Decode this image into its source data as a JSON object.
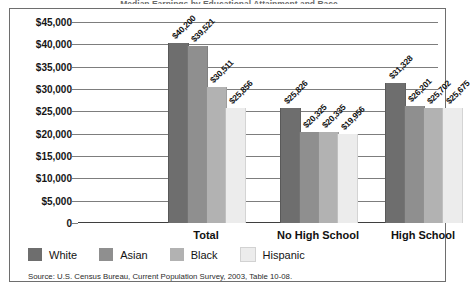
{
  "figure": {
    "title_clipped": "Median Earnings by Educational Attainment and Race",
    "source_note": "Source: U.S. Census Bureau, Current Population Survey, 2003, Table 10-08.",
    "border_color": "#6e6e6e",
    "gridline_color": "#7d7d7d"
  },
  "legend": {
    "position": "bottom-left",
    "items": [
      {
        "label": "White",
        "color": "#6e6e6e"
      },
      {
        "label": "Asian",
        "color": "#8f8f8f"
      },
      {
        "label": "Black",
        "color": "#b2b2b2"
      },
      {
        "label": "Hispanic",
        "color": "#ececec"
      }
    ]
  },
  "chart_data": {
    "type": "bar",
    "title": "Median Earnings by Educational Attainment and Race",
    "xlabel": "",
    "ylabel": "",
    "ylim": [
      0,
      45000
    ],
    "ytick_values": [
      0,
      5000,
      10000,
      15000,
      20000,
      25000,
      30000,
      35000,
      40000,
      45000
    ],
    "ytick_labels": [
      "0",
      "$5,000",
      "$10,000",
      "$15,000",
      "$20,000",
      "$25,000",
      "$30,000",
      "$35,000",
      "$40,000",
      "$45,000"
    ],
    "grid": true,
    "legend_position": "bottom-left",
    "categories": [
      "Total",
      "No High School",
      "High School"
    ],
    "series": [
      {
        "name": "White",
        "color": "#6e6e6e",
        "values": [
          40200,
          25826,
          31328
        ],
        "labels": [
          "$40,200",
          "$25,826",
          "$31,328"
        ]
      },
      {
        "name": "Asian",
        "color": "#8f8f8f",
        "values": [
          39521,
          20325,
          26201
        ],
        "labels": [
          "$39,521",
          "$20,325",
          "$26,201"
        ]
      },
      {
        "name": "Black",
        "color": "#b2b2b2",
        "values": [
          30511,
          20335,
          25702
        ],
        "labels": [
          "$30,511",
          "$20,335",
          "$25,702"
        ]
      },
      {
        "name": "Hispanic",
        "color": "#ececec",
        "values": [
          25856,
          19956,
          25675
        ],
        "labels": [
          "$25,856",
          "$19,956",
          "$25,675"
        ]
      }
    ]
  }
}
